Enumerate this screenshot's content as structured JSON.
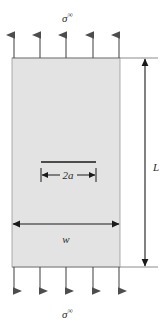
{
  "figure": {
    "name": "center-cracked-plate-under-remote-tension",
    "domain": "mechanics-diagram",
    "background_color": "#ffffff",
    "plate": {
      "fill_color": "#e3e3e3",
      "stroke_color": "#808080",
      "x": 12,
      "y": 58,
      "width": 108,
      "height": 209
    },
    "labels": {
      "stress_top": "σ",
      "stress_top_sup": "∞",
      "stress_bottom": "σ",
      "stress_bottom_sup": "∞",
      "crack_length": "2a",
      "plate_width": "w",
      "plate_length": "L"
    },
    "edge_lines": {
      "color": "#808080",
      "top_y": 58,
      "bottom_y": 267,
      "x_start": 12,
      "x_end": 158
    },
    "load_arrows": {
      "color": "#4d4d4d",
      "count_top": 5,
      "count_bottom": 5,
      "x_positions": [
        14,
        40,
        66,
        93,
        119
      ],
      "top_tail_y": 58,
      "top_head_y": 30,
      "bottom_tail_y": 267,
      "bottom_head_y": 296
    },
    "crack": {
      "color": "#1a1a1a",
      "y": 162,
      "x_start": 41,
      "x_end": 96
    },
    "dimension_2a": {
      "color": "#1a1a1a",
      "y": 175,
      "x_start": 41,
      "x_end": 96,
      "tick_half_height": 7,
      "label": "2a",
      "label_x": 68,
      "label_y": 179
    },
    "dimension_w": {
      "color": "#1a1a1a",
      "y": 224,
      "x_start": 12,
      "x_end": 120,
      "label": "w",
      "label_x": 66,
      "label_y": 243
    },
    "dimension_L": {
      "color": "#1a1a1a",
      "x": 145,
      "y_start": 58,
      "y_end": 267,
      "label": "L",
      "label_x": 155,
      "label_y": 170
    },
    "sigma_top": {
      "x": 67,
      "y": 20
    },
    "sigma_bottom": {
      "x": 67,
      "y": 317
    }
  }
}
